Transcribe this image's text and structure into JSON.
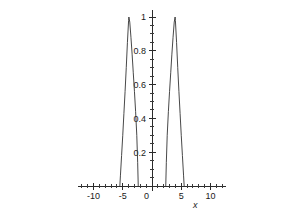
{
  "chart_data": {
    "type": "line",
    "title": "",
    "subtitle": "",
    "xlabel": "x",
    "ylabel": "",
    "xlim": [
      -12.6,
      12.6
    ],
    "ylim": [
      0,
      1.04
    ],
    "grid": false,
    "legend": false,
    "legend_position": "none",
    "x_ticks_major": [
      -10,
      -5,
      0,
      5,
      10
    ],
    "x_tick_labels": [
      "-10",
      "-5",
      "0",
      "5",
      "10"
    ],
    "x_tick_minor_step": 1,
    "y_ticks_major": [
      0.2,
      0.4,
      0.6,
      0.8,
      1
    ],
    "y_tick_labels": [
      "0.2",
      "0.4",
      "0.6",
      "0.8",
      "1"
    ],
    "y_tick_minor_step": 0.05,
    "origin_label": "0",
    "series": [
      {
        "name": "left-bump",
        "color": "#333333",
        "support": [
          -5.5,
          -2.35
        ],
        "center": -3.95,
        "peak": 1,
        "x": [
          -5.5,
          -5.4,
          -5.2,
          -5.0,
          -4.8,
          -4.6,
          -4.4,
          -4.2,
          -4.0,
          -3.95,
          -3.8,
          -3.6,
          -3.4,
          -3.2,
          -3.0,
          -2.8,
          -2.6,
          -2.45,
          -2.35
        ],
        "y": [
          0,
          0.06,
          0.18,
          0.3,
          0.43,
          0.56,
          0.7,
          0.85,
          0.98,
          1.0,
          0.97,
          0.88,
          0.78,
          0.67,
          0.56,
          0.44,
          0.3,
          0.14,
          0
        ]
      },
      {
        "name": "right-bump",
        "color": "#333333",
        "support": [
          2.35,
          5.5
        ],
        "center": 3.95,
        "peak": 1,
        "x": [
          2.35,
          2.45,
          2.6,
          2.8,
          3.0,
          3.2,
          3.4,
          3.6,
          3.8,
          3.95,
          4.0,
          4.2,
          4.4,
          4.6,
          4.8,
          5.0,
          5.2,
          5.4,
          5.5
        ],
        "y": [
          0,
          0.14,
          0.3,
          0.44,
          0.56,
          0.67,
          0.78,
          0.88,
          0.97,
          1.0,
          0.98,
          0.85,
          0.7,
          0.56,
          0.43,
          0.3,
          0.18,
          0.06,
          0
        ]
      }
    ],
    "colors": {
      "background": "#ffffff",
      "axis": "#2b2b2b",
      "curve": "#333333",
      "text": "#1a1a1a"
    }
  }
}
